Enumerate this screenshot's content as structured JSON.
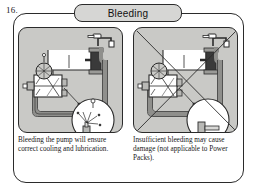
{
  "figure": {
    "number": "16.",
    "title": "Bleeding"
  },
  "panels": [
    {
      "id": "correct",
      "position": "left",
      "marked_incorrect": false,
      "caption": "Bleeding the pump will ensure correct cooling and lubrication.",
      "elements": {
        "tap": "faucet-tap",
        "tank": "reservoir-tank",
        "filter": "filter-cartridge",
        "pump": "pump-unit",
        "gauge": "pressure-gauge",
        "detail_bubble": "spray-detail-circle"
      }
    },
    {
      "id": "incorrect",
      "position": "right",
      "marked_incorrect": true,
      "caption": "Insufficient bleeding may cause damage (not applicable to Power Packs).",
      "elements": {
        "tap": "faucet-tap",
        "tank": "reservoir-tank",
        "filter": "filter-cartridge",
        "pump": "pump-unit",
        "gauge": "pressure-gauge",
        "detail_bubble": "no-spray-detail-circle"
      }
    }
  ],
  "colors": {
    "panel_fill": "#c9c9c6",
    "tab_fill": "#d6d6d4",
    "line": "#2b2b2b",
    "pipe": "#8f8f8c",
    "dark_part": "#3a3a3a",
    "white": "#ffffff"
  }
}
